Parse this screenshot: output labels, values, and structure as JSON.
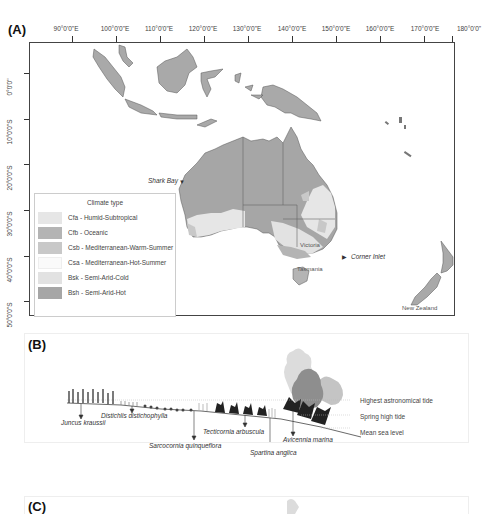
{
  "panels": {
    "a": {
      "label": "(A)",
      "x_ticks": [
        "90°0'0\"E",
        "100°0'0\"E",
        "110°0'0\"E",
        "120°0'0\"E",
        "130°0'0\"E",
        "140°0'0\"E",
        "150°0'0\"E",
        "160°0'0\"E",
        "170°0'0\"E",
        "180°0'0\""
      ],
      "y_ticks": [
        "0°0'0\"",
        "10°0'0\"S",
        "20°0'0\"S",
        "30°0'0\"S",
        "40°0'0\"S",
        "50°0'0\"S"
      ],
      "legend": {
        "title": "Climate type",
        "items": [
          {
            "label": "Cfa - Humid-Subtropical",
            "color": "#e6e6e6"
          },
          {
            "label": "Cfb - Oceanic",
            "color": "#b4b4b4"
          },
          {
            "label": "Csb - Mediterranean-Warm-Summer",
            "color": "#c8c8c8"
          },
          {
            "label": "Csa - Mediterranean-Hot-Summer",
            "color": "#fafafa"
          },
          {
            "label": "Bsk - Semi-Arid-Cold",
            "color": "#e2e2e2"
          },
          {
            "label": "Bsh - Semi-Arid-Hot",
            "color": "#a6a6a6"
          }
        ]
      },
      "annotations": {
        "shark_bay": "Shark Bay",
        "corner_inlet": "Corner Inlet"
      },
      "regions": {
        "victoria": "Victoria",
        "tasmania": "Tasmania",
        "new_zealand": "New Zealand"
      },
      "colors": {
        "land": "#a9a9a9",
        "land_border": "#555555",
        "frame": "#444444"
      }
    },
    "b": {
      "label": "(B)",
      "tide_levels": [
        "Highest astronomical tide",
        "Spring high tide",
        "Mean sea level"
      ],
      "species": [
        "Juncus kraussii",
        "Distichlis distichophylla",
        "Sarcocornia quinqueflora",
        "Tecticornia arbuscula",
        "Spartina anglica",
        "Avicennia marina"
      ]
    },
    "c": {
      "label": "(C)"
    }
  }
}
